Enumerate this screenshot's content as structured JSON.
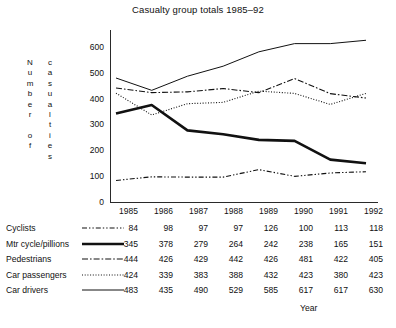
{
  "chart_data": {
    "type": "line",
    "title": "Casualty group totals 1985–92",
    "xlabel": "Year",
    "ylabel_lines": [
      "Number of",
      "casualties"
    ],
    "x": [
      "1985",
      "1986",
      "1987",
      "1988",
      "1989",
      "1990",
      "1991",
      "1992"
    ],
    "categories": [
      "1985",
      "1986",
      "1987",
      "1988",
      "1989",
      "1990",
      "1991",
      "1992"
    ],
    "ylim": [
      0,
      670
    ],
    "yticks": [
      0,
      100,
      200,
      300,
      400,
      500,
      600
    ],
    "ytick_labels": [
      "0",
      "100",
      "200",
      "300",
      "400",
      "500",
      "600"
    ],
    "grid": false,
    "legend": "table-below",
    "series": [
      {
        "name": "Cyclists",
        "style": "dash-dot-dot",
        "width": 1.1,
        "color": "#111111",
        "values": [
          84,
          98,
          97,
          97,
          126,
          100,
          113,
          118
        ]
      },
      {
        "name": "Mtr cycle/pillions",
        "style": "solid-thick",
        "width": 2.6,
        "color": "#111111",
        "values": [
          345,
          378,
          279,
          264,
          242,
          238,
          165,
          151
        ]
      },
      {
        "name": "Pedestrians",
        "style": "dash-dot",
        "width": 1.1,
        "color": "#111111",
        "values": [
          444,
          426,
          429,
          442,
          426,
          481,
          422,
          405
        ]
      },
      {
        "name": "Car passengers",
        "style": "dotted",
        "width": 1.1,
        "color": "#111111",
        "values": [
          424,
          339,
          383,
          388,
          432,
          423,
          380,
          423
        ]
      },
      {
        "name": "Car drivers",
        "style": "solid-thin",
        "width": 1.0,
        "color": "#111111",
        "values": [
          483,
          435,
          490,
          529,
          585,
          617,
          617,
          630
        ]
      }
    ]
  },
  "table": {
    "year_header": [
      "1985",
      "1986",
      "1987",
      "1988",
      "1989",
      "1990",
      "1991",
      "1992"
    ],
    "rows": [
      {
        "label": "Cyclists",
        "values": [
          "84",
          "98",
          "97",
          "97",
          "126",
          "100",
          "113",
          "118"
        ]
      },
      {
        "label": "Mtr cycle/pillions",
        "values": [
          "345",
          "378",
          "279",
          "264",
          "242",
          "238",
          "165",
          "151"
        ]
      },
      {
        "label": "Pedestrians",
        "values": [
          "444",
          "426",
          "429",
          "442",
          "426",
          "481",
          "422",
          "405"
        ]
      },
      {
        "label": "Car passengers",
        "values": [
          "424",
          "339",
          "383",
          "388",
          "432",
          "423",
          "380",
          "423"
        ]
      },
      {
        "label": "Car drivers",
        "values": [
          "483",
          "435",
          "490",
          "529",
          "585",
          "617",
          "617",
          "630"
        ]
      }
    ]
  }
}
